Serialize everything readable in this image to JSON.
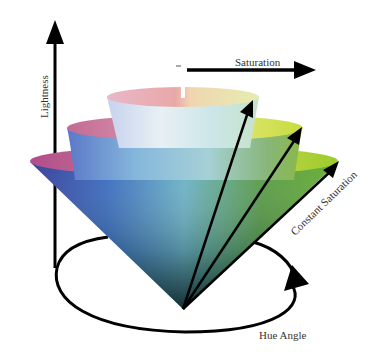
{
  "diagram": {
    "labels": {
      "lightness": "Lightness",
      "saturation": "Saturation",
      "constant_saturation": "Constant Saturation",
      "hue_angle": "Hue Angle"
    },
    "axes": [
      {
        "name": "Lightness",
        "direction": "vertical-up"
      },
      {
        "name": "Saturation",
        "direction": "horizontal-right"
      },
      {
        "name": "Hue Angle",
        "direction": "circular"
      }
    ],
    "cones": [
      {
        "name": "small-cone",
        "level": "highest lightness"
      },
      {
        "name": "medium-cone",
        "level": "middle"
      },
      {
        "name": "large-cone",
        "level": "lowest saturation band"
      }
    ],
    "colors": {
      "arrow": "#000000",
      "magenta": "#c06a9a",
      "blue": "#2f55a8",
      "cyan": "#7fc4d4",
      "green": "#5aa030",
      "yellow": "#d6e24a",
      "apex": "#0b2a2a"
    }
  }
}
